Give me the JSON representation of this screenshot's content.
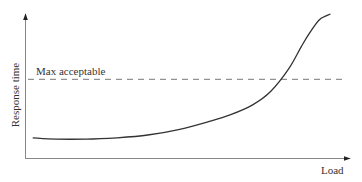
{
  "chart_data": {
    "type": "line",
    "title": "",
    "xlabel": "Load",
    "ylabel": "Response time",
    "grid": false,
    "legend": null,
    "axis_ticks": false,
    "xlim": [
      0,
      100
    ],
    "ylim": [
      0,
      100
    ],
    "series": [
      {
        "name": "Response time vs load",
        "x": [
          2.5,
          10,
          20,
          30,
          40,
          50,
          60,
          67,
          74,
          80,
          86,
          90,
          93,
          96,
          99.5
        ],
        "y": [
          9,
          8,
          8,
          9,
          11,
          15,
          21,
          26,
          33,
          43,
          60,
          76,
          87,
          96,
          100
        ]
      }
    ],
    "annotations": [
      {
        "type": "hline",
        "y": 52,
        "style": "dashed",
        "label": "Max acceptable"
      }
    ]
  },
  "labels": {
    "ylabel": "Response time",
    "xlabel": "Load",
    "threshold": "Max acceptable"
  }
}
